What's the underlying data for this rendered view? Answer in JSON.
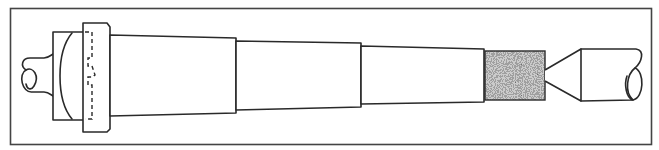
{
  "diagram": {
    "title": "",
    "components": [
      {
        "id": "left-shaft",
        "label": ""
      },
      {
        "id": "collet",
        "label": ""
      },
      {
        "id": "flange",
        "label": ""
      },
      {
        "id": "spindle-section-1",
        "label": ""
      },
      {
        "id": "spindle-section-2",
        "label": ""
      },
      {
        "id": "spindle-section-3",
        "label": ""
      },
      {
        "id": "abrasive-wheel",
        "label": ""
      },
      {
        "id": "cone-point",
        "label": ""
      },
      {
        "id": "right-shaft",
        "label": ""
      }
    ],
    "colors": {
      "line": "#2a2a2a",
      "frame": "#444444",
      "background": "#ffffff",
      "abrasive_dark": "#3a3a3a",
      "abrasive_light": "#e8e8e8"
    }
  }
}
